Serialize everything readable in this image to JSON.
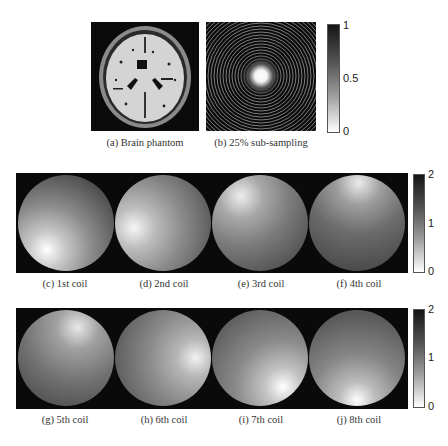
{
  "figure": {
    "top_row": {
      "panels": [
        {
          "id": "a",
          "caption": "(a) Brain phantom"
        },
        {
          "id": "b",
          "caption": "(b) 25% sub-sampling"
        }
      ],
      "colorbar": {
        "max": "1",
        "mid": "0.5",
        "min": "0"
      }
    },
    "coil_rows": [
      {
        "panels": [
          {
            "id": "c",
            "caption": "(c) 1st coil"
          },
          {
            "id": "d",
            "caption": "(d) 2nd coil"
          },
          {
            "id": "e",
            "caption": "(e) 3rd coil"
          },
          {
            "id": "f",
            "caption": "(f) 4th coil"
          }
        ],
        "colorbar": {
          "max": "2",
          "mid": "1",
          "min": "0"
        }
      },
      {
        "panels": [
          {
            "id": "g",
            "caption": "(g) 5th coil"
          },
          {
            "id": "h",
            "caption": "(h) 6th coil"
          },
          {
            "id": "i",
            "caption": "(i) 7th coil"
          },
          {
            "id": "j",
            "caption": "(j) 8th coil"
          }
        ],
        "colorbar": {
          "max": "2",
          "mid": "1",
          "min": "0"
        }
      }
    ]
  }
}
